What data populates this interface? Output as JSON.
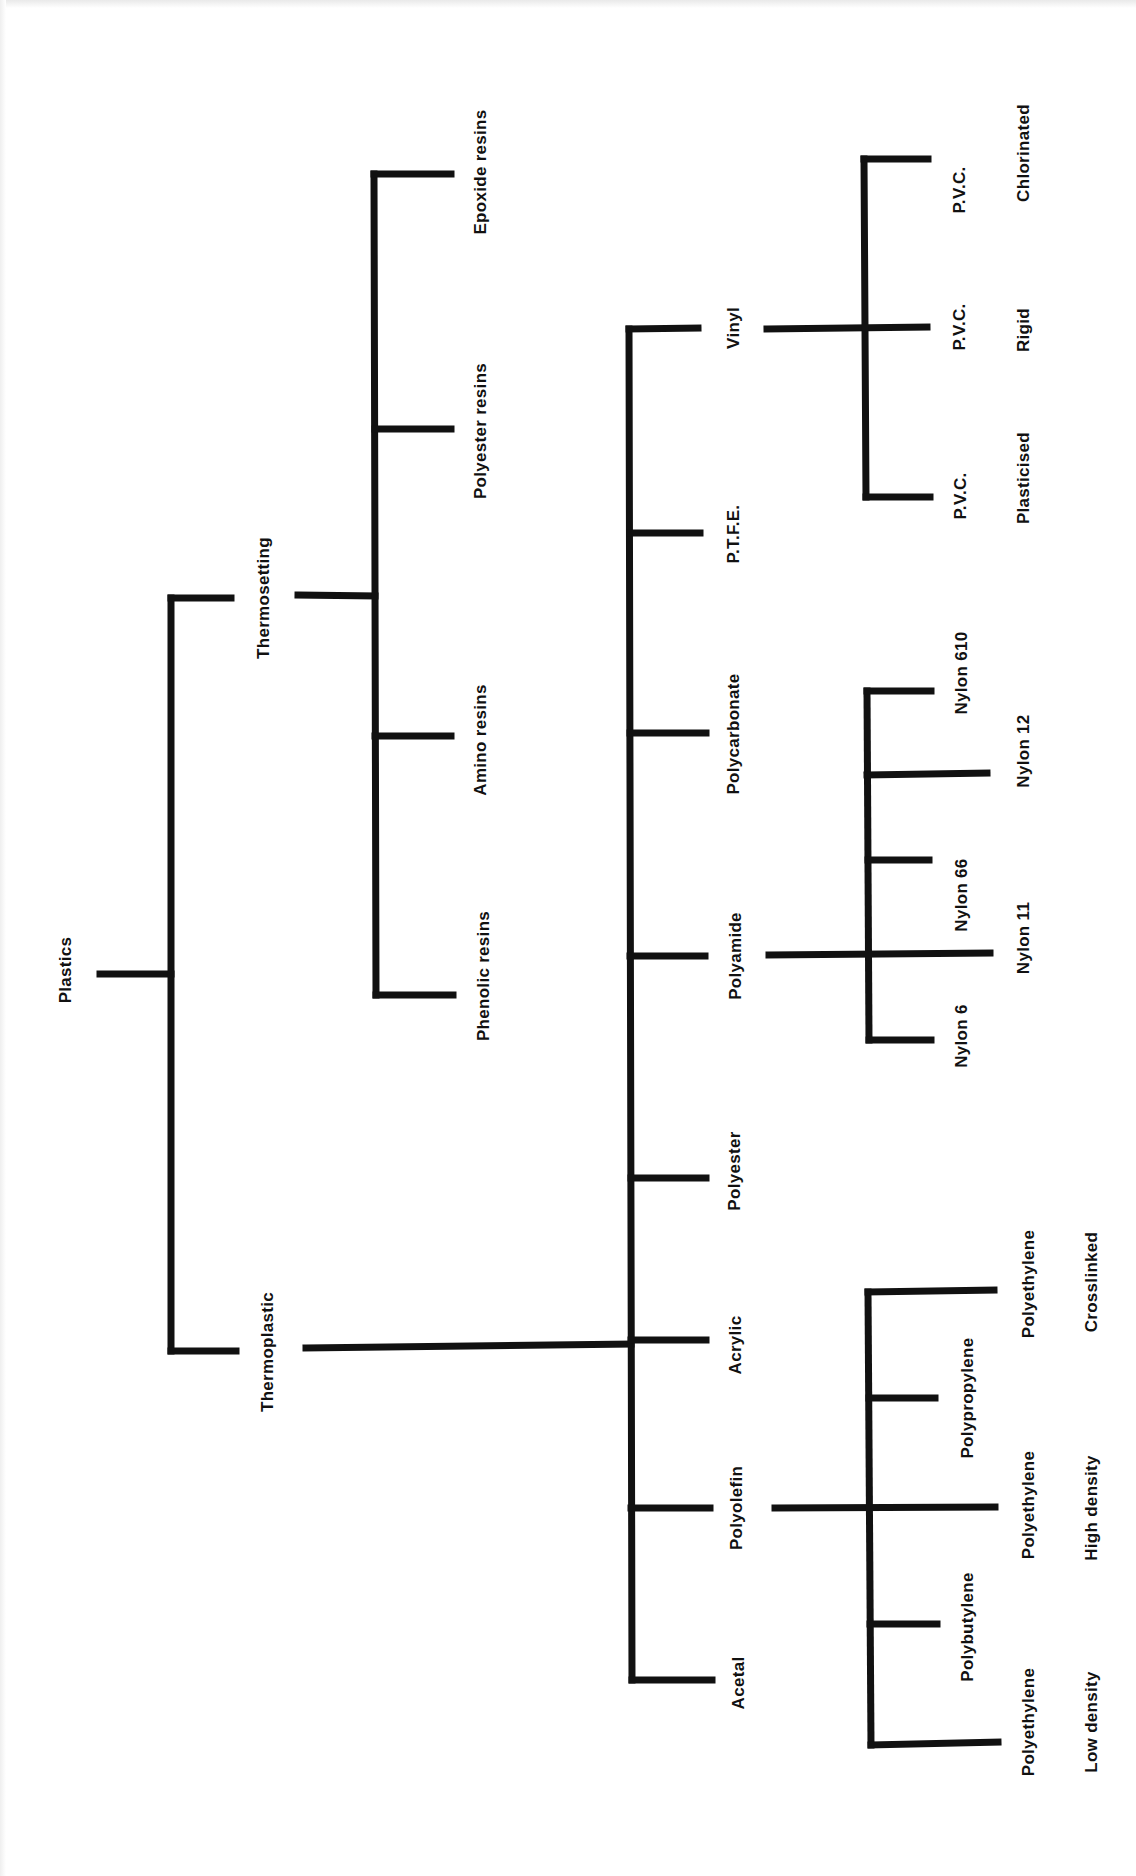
{
  "diagram": {
    "type": "classification-tree",
    "orientation": "rotated-90",
    "line_color": "#111111",
    "background": "#ffffff",
    "root": {
      "label": "Plastics",
      "children": [
        {
          "label": "Thermosetting",
          "children": [
            {
              "label": "Epoxide resins"
            },
            {
              "label": "Polyester resins"
            },
            {
              "label": "Amino resins"
            },
            {
              "label": "Phenolic resins"
            }
          ]
        },
        {
          "label": "Thermoplastic",
          "children": [
            {
              "label": "Vinyl",
              "children": [
                {
                  "line1": "P.V.C.",
                  "line2": "Chlorinated"
                },
                {
                  "line1": "P.V.C.",
                  "line2": "Rigid"
                },
                {
                  "line1": "P.V.C.",
                  "line2": "Plasticised"
                }
              ]
            },
            {
              "label": "P.T.F.E."
            },
            {
              "label": "Polycarbonate"
            },
            {
              "label": "Polyamide",
              "children": [
                {
                  "label": "Nylon 610"
                },
                {
                  "label": "Nylon 12"
                },
                {
                  "label": "Nylon 66"
                },
                {
                  "label": "Nylon 11"
                },
                {
                  "label": "Nylon 6"
                }
              ]
            },
            {
              "label": "Polyester"
            },
            {
              "label": "Acrylic"
            },
            {
              "label": "Polyolefin",
              "children": [
                {
                  "line1": "Polyethylene",
                  "line2": "Crosslinked"
                },
                {
                  "label": "Polypropylene"
                },
                {
                  "line1": "Polyethylene",
                  "line2": "High density"
                },
                {
                  "label": "Polybutylene"
                },
                {
                  "line1": "Polyethylene",
                  "line2": "Low density"
                }
              ]
            },
            {
              "label": "Acetal"
            }
          ]
        }
      ]
    }
  }
}
